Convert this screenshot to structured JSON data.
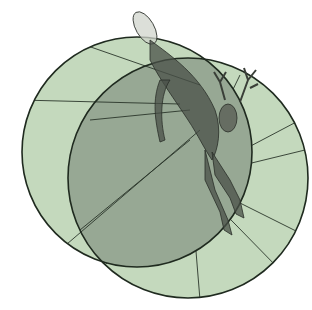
{
  "illustration": {
    "subject": "leaping deer over two overlapping circles",
    "colors": {
      "circle_fill": "#c4d9bd",
      "overlap_fill": "#97a894",
      "stroke": "#1f2a1f",
      "deer": "#3a3f38",
      "background": "#ffffff"
    }
  }
}
